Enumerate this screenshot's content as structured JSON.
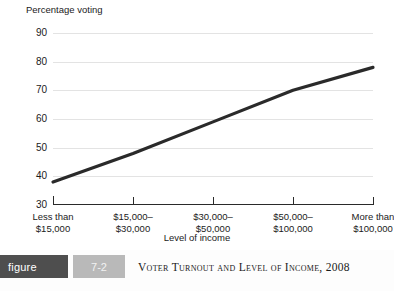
{
  "figure": {
    "badge_label": "figure",
    "number": "7-2",
    "caption": "Voter Turnout and Level of Income, 2008",
    "badge_color": "#4e4e4e",
    "number_color": "#b9b9b9"
  },
  "chart_data": {
    "type": "line",
    "title": "Voter Turnout and Level of Income, 2008",
    "ylabel": "Percentage voting",
    "xlabel": "Level of income",
    "categories": [
      "Less than\n$15,000",
      "$15,000–\n$30,000",
      "$30,000–\n$50,000",
      "$50,000–\n$100,000",
      "More than\n$100,000"
    ],
    "category_lines": [
      [
        "Less than",
        "$15,000"
      ],
      [
        "$15,000–",
        "$30,000"
      ],
      [
        "$30,000–",
        "$50,000"
      ],
      [
        "$50,000–",
        "$100,000"
      ],
      [
        "More than",
        "$100,000"
      ]
    ],
    "values": [
      38,
      48,
      59,
      70,
      78
    ],
    "ylim": [
      30,
      90
    ],
    "yticks": [
      30,
      40,
      50,
      60,
      70,
      80,
      90
    ],
    "grid": true,
    "legend": "none",
    "line_color": "#2a2a2a",
    "grid_color": "#e3e3e3"
  }
}
